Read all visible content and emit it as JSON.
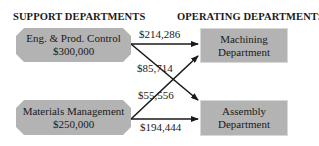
{
  "headings": {
    "support": "SUPPORT DEPARTMENTS",
    "operating": "OPERATING DEPARTMENTS"
  },
  "support_departments": [
    {
      "name": "Eng. & Prod. Control",
      "cost": "$300,000"
    },
    {
      "name": "Materials Management",
      "cost": "$250,000"
    }
  ],
  "operating_departments": [
    {
      "name_line1": "Machining",
      "name_line2": "Department"
    },
    {
      "name_line1": "Assembly",
      "name_line2": "Department"
    }
  ],
  "allocations": [
    {
      "from": "Eng. & Prod. Control",
      "to": "Machining Department",
      "amount": "$214,286"
    },
    {
      "from": "Eng. & Prod. Control",
      "to": "Assembly Department",
      "amount": "$85,714"
    },
    {
      "from": "Materials Management",
      "to": "Machining Department",
      "amount": "$55,556"
    },
    {
      "from": "Materials Management",
      "to": "Assembly Department",
      "amount": "$194,444"
    }
  ],
  "colors": {
    "box_fill": "#b3b3b3",
    "arrow": "#1a1a1a"
  }
}
